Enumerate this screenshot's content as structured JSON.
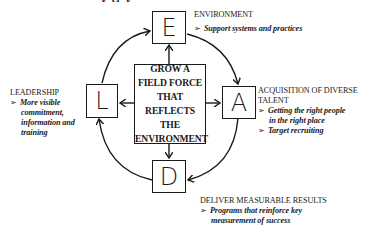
{
  "diagram": {
    "title_partial": "y  g y",
    "center": {
      "text": "GROW A FIELD FORCE THAT REFLECTS THE ENVIRONMENT"
    },
    "nodes": [
      {
        "id": "E",
        "letter": "E",
        "heading": "ENVIRONMENT",
        "bullets": [
          "Support systems and practices"
        ]
      },
      {
        "id": "A",
        "letter": "A",
        "heading_line1": "ACQUISITION OF DIVERSE",
        "heading_line2": "TALENT",
        "bullets": [
          "Getting the right people in the right place",
          "Target recruiting"
        ],
        "bullet1_line1": "Getting the right people",
        "bullet1_line2": "in the right place"
      },
      {
        "id": "D",
        "letter": "D",
        "heading": "DELIVER MEASURABLE RESULTS",
        "bullets": [
          "Programs that reinforce key measurement of success"
        ],
        "bullet1_line1": "Programs that reinforce key",
        "bullet1_line2": "measurement of success"
      },
      {
        "id": "L",
        "letter": "L",
        "heading": "LEADERSHIP",
        "bullets": [
          "More visible commitment, information and training"
        ],
        "bullet1_line1": "More visible",
        "bullet1_line2": "commitment,",
        "bullet1_line3": "information and",
        "bullet1_line4": "training"
      }
    ],
    "bullet_glyph": "➢",
    "cycle_order": [
      "L",
      "E",
      "A",
      "D",
      "L"
    ],
    "colors": {
      "stroke": "#1a1a1a",
      "background": "#ffffff"
    }
  }
}
